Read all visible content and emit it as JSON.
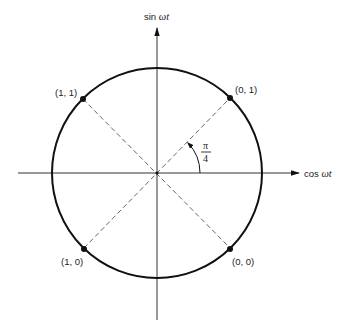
{
  "diagram": {
    "type": "unit-circle phase diagram",
    "axes": {
      "horizontal": {
        "label_prefix": "cos ",
        "label_var": "ωt"
      },
      "vertical": {
        "label_prefix": "sin ",
        "label_var": "ωt"
      }
    },
    "angle": {
      "numerator": "π",
      "denominator": "4"
    },
    "points": [
      {
        "id": "upper-left",
        "label": "(1, 1)"
      },
      {
        "id": "upper-right",
        "label": "(0, 1)"
      },
      {
        "id": "lower-left",
        "label": "(1, 0)"
      },
      {
        "id": "lower-right",
        "label": "(0, 0)"
      }
    ],
    "colors": {
      "stroke": "#111111",
      "dashed": "#555555",
      "background": "#ffffff"
    }
  }
}
